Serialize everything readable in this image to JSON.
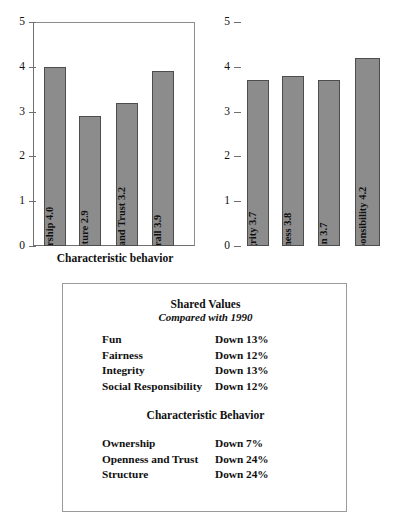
{
  "chart_data": [
    {
      "type": "bar",
      "id": "characteristic-behavior",
      "title": "",
      "xlabel": "Characteristic behavior",
      "ylabel": "",
      "ylim": [
        0,
        5
      ],
      "yticks": [
        "0",
        "1",
        "2",
        "3",
        "4",
        "5"
      ],
      "grid": false,
      "legend": "none",
      "categories": [
        "Ownership",
        "Structure",
        "Openness and Trust",
        "Overall"
      ],
      "values": [
        4.0,
        2.9,
        3.2,
        3.9
      ],
      "bar_labels": [
        "Ownership 4.0",
        "Structure 2.9",
        "Openness and Trust 3.2",
        "Overall 3.9"
      ],
      "bar_color": "#8c8c8c",
      "bar_edge_color": "#4d4d4d"
    },
    {
      "type": "bar",
      "id": "shared-values",
      "title": "",
      "xlabel": "Shared values",
      "ylabel": "",
      "ylim": [
        0,
        5
      ],
      "yticks": [
        "0",
        "1",
        "2",
        "3",
        "4",
        "5"
      ],
      "grid": false,
      "legend": "none",
      "categories": [
        "Integrity",
        "Fairness",
        "Fun",
        "Social responsibility"
      ],
      "values": [
        3.7,
        3.8,
        3.7,
        4.2
      ],
      "bar_labels": [
        "Integrity 3.7",
        "Fairness 3.8",
        "Fun 3.7",
        "Social responsibility 4.2"
      ],
      "bar_color": "#8c8c8c",
      "bar_edge_color": "#4d4d4d"
    }
  ],
  "summary_box": {
    "shared_values": {
      "heading": "Shared Values",
      "subheading": "Compared with 1990",
      "rows": [
        {
          "label": "Fun",
          "value": "Down 13%"
        },
        {
          "label": "Fairness",
          "value": "Down 12%"
        },
        {
          "label": "Integrity",
          "value": "Down 13%"
        },
        {
          "label": "Social Responsibility",
          "value": "Down 12%"
        }
      ]
    },
    "characteristic_behavior": {
      "heading": "Characteristic Behavior",
      "rows": [
        {
          "label": "Ownership",
          "value": "Down 7%"
        },
        {
          "label": "Openness and Trust",
          "value": "Down 24%"
        },
        {
          "label": "Structure",
          "value": "Down 24%"
        }
      ]
    }
  }
}
